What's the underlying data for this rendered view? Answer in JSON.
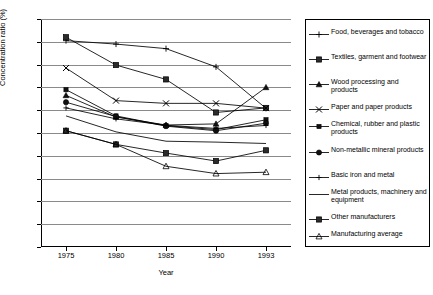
{
  "chart_data": {
    "type": "line",
    "title": "",
    "xlabel": "Year",
    "ylabel": "Concentration ratio (%)",
    "x": [
      "1975",
      "1980",
      "1985",
      "1990",
      "1993"
    ],
    "categories": [
      "1975",
      "1980",
      "1985",
      "1990",
      "1993"
    ],
    "xtick_labels": [
      "1975",
      "1980",
      "1985",
      "1990",
      "1993"
    ],
    "ytick_labels": [
      "0",
      "10",
      "20",
      "30",
      "40",
      "50",
      "60",
      "70",
      "80",
      "90",
      "100"
    ],
    "ylim": [
      0,
      100
    ],
    "ytick_step": 10,
    "grid": "horizontal",
    "legend_position": "right-outside",
    "series": [
      {
        "name": "Food, beverages and tobacco",
        "marker": "plus",
        "values": [
          90.5,
          89.0,
          87.0,
          79.0,
          60.8
        ]
      },
      {
        "name": "Textiles, garment and footwear",
        "marker": "square-filled",
        "values": [
          92.0,
          79.8,
          73.5,
          59.0,
          61.0
        ]
      },
      {
        "name": "Wood processing and products",
        "marker": "triangle-filled",
        "values": [
          66.5,
          57.0,
          53.5,
          54.0,
          70.0
        ]
      },
      {
        "name": "Paper and paper products",
        "marker": "cross-x",
        "values": [
          78.5,
          64.2,
          63.0,
          63.0,
          60.9
        ]
      },
      {
        "name": "Chemical, rubber and plastic products",
        "marker": "square-small-filled",
        "values": [
          69.0,
          57.5,
          53.2,
          51.5,
          55.8
        ]
      },
      {
        "name": "Non-metallic mineral products",
        "marker": "circle-filled",
        "values": [
          63.5,
          57.2,
          53.0,
          51.0,
          54.3
        ]
      },
      {
        "name": "Basic iron and metal",
        "marker": "plus-thin",
        "values": [
          61.0,
          56.2,
          53.4,
          52.0,
          53.3
        ]
      },
      {
        "name": "Metal products, machinery and equipment",
        "marker": "none",
        "values": [
          57.5,
          50.5,
          46.4,
          46.0,
          45.4
        ]
      },
      {
        "name": "Other manufacturers",
        "marker": "square-filled-2",
        "values": [
          51.0,
          45.0,
          41.2,
          37.7,
          42.4
        ]
      },
      {
        "name": "Manufacturing average",
        "marker": "triangle-open",
        "values": [
          51.0,
          45.0,
          35.4,
          32.2,
          32.8
        ]
      }
    ]
  },
  "legend": {
    "items": [
      {
        "label": "Food, beverages and tobacco"
      },
      {
        "label": "Textiles, garment and footwear"
      },
      {
        "label": "Wood processing and products"
      },
      {
        "label": "Paper and paper products"
      },
      {
        "label": "Chemical, rubber and plastic products"
      },
      {
        "label": "Non-metallic mineral products"
      },
      {
        "label": "Basic iron and metal"
      },
      {
        "label": "Metal products, machinery and equipment"
      },
      {
        "label": "Other manufacturers"
      },
      {
        "label": "Manufacturing average"
      }
    ]
  },
  "colors": {
    "line": "#000000",
    "grid": "#8a8a8a",
    "axis": "#000000",
    "background": "#ffffff"
  }
}
